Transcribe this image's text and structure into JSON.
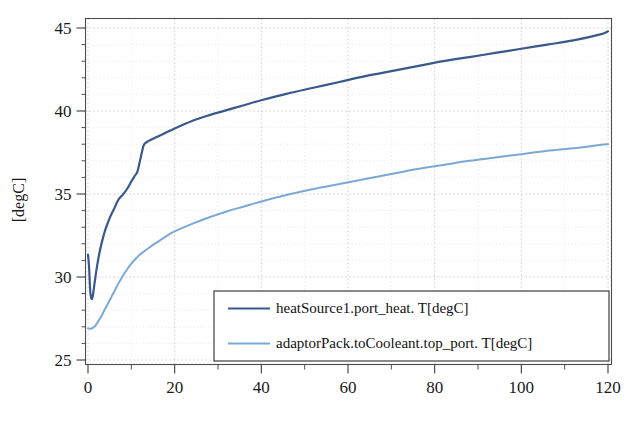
{
  "chart_data": {
    "type": "line",
    "title": "",
    "xlabel": "",
    "ylabel": "[degC]",
    "xlim": [
      0,
      120
    ],
    "ylim": [
      25,
      45
    ],
    "xticks": [
      0,
      20,
      40,
      60,
      80,
      100,
      120
    ],
    "xtick_labels": [
      "0",
      "20",
      "40",
      "60",
      "80",
      "100",
      "120"
    ],
    "xticks_minor": [
      10,
      30,
      50,
      70,
      90,
      110
    ],
    "yticks": [
      25,
      30,
      35,
      40,
      45
    ],
    "ytick_labels": [
      "25",
      "30",
      "35",
      "40",
      "45"
    ],
    "grid": true,
    "legend_position": "lower-center-right",
    "series": [
      {
        "name": "heatSource1.port_heat. T[degC]",
        "color": "#39598c",
        "width": 2.2,
        "x": [
          0,
          0.25,
          0.5,
          0.8,
          1.1,
          1.5,
          2,
          2.6,
          3.2,
          4,
          5,
          6,
          7,
          8,
          9,
          10,
          10.8,
          11.4,
          12,
          12.6,
          13,
          14,
          16,
          18,
          20,
          24,
          28,
          32,
          36,
          40,
          46,
          52,
          58,
          64,
          70,
          76,
          82,
          88,
          94,
          100,
          106,
          112,
          118,
          120
        ],
        "y": [
          31.35,
          30.6,
          29.2,
          28.7,
          28.85,
          29.6,
          30.5,
          31.4,
          32.1,
          32.85,
          33.55,
          34.1,
          34.65,
          34.95,
          35.3,
          35.75,
          36.1,
          36.35,
          37.0,
          37.7,
          38.0,
          38.2,
          38.45,
          38.7,
          38.95,
          39.4,
          39.75,
          40.05,
          40.35,
          40.65,
          41.05,
          41.4,
          41.75,
          42.1,
          42.4,
          42.7,
          43.0,
          43.25,
          43.5,
          43.75,
          44.0,
          44.25,
          44.6,
          44.8
        ]
      },
      {
        "name": "adaptorPack.toCooleant.top_port. T[degC]",
        "color": "#7ba8d4",
        "width": 2.0,
        "x": [
          0,
          0.6,
          1.2,
          1.8,
          2.4,
          3.2,
          4,
          5,
          6,
          7,
          8,
          9,
          10,
          11,
          12,
          13,
          14,
          16,
          18,
          20,
          24,
          28,
          32,
          36,
          40,
          46,
          52,
          58,
          64,
          70,
          76,
          82,
          88,
          94,
          100,
          106,
          112,
          118,
          120
        ],
        "y": [
          26.9,
          26.88,
          26.95,
          27.1,
          27.35,
          27.7,
          28.1,
          28.6,
          29.1,
          29.6,
          30.05,
          30.45,
          30.8,
          31.1,
          31.35,
          31.55,
          31.75,
          32.1,
          32.45,
          32.75,
          33.2,
          33.6,
          33.95,
          34.25,
          34.55,
          34.95,
          35.3,
          35.6,
          35.9,
          36.2,
          36.5,
          36.75,
          37.0,
          37.2,
          37.4,
          37.6,
          37.75,
          37.95,
          38.0
        ]
      }
    ]
  },
  "legend": {
    "entries": [
      {
        "label": "heatSource1.port_heat. T[degC]",
        "color": "#39598c"
      },
      {
        "label": "adaptorPack.toCooleant.top_port. T[degC]",
        "color": "#7ba8d4"
      }
    ]
  },
  "axes": {
    "y_axis_title": "[degC]"
  },
  "colors": {
    "series_primary": "#39598c",
    "series_secondary": "#7ba8d4",
    "frame": "#4d4d4d",
    "grid": "#c9c9d4",
    "background": "#ffffff",
    "text": "#1a1a1a"
  }
}
